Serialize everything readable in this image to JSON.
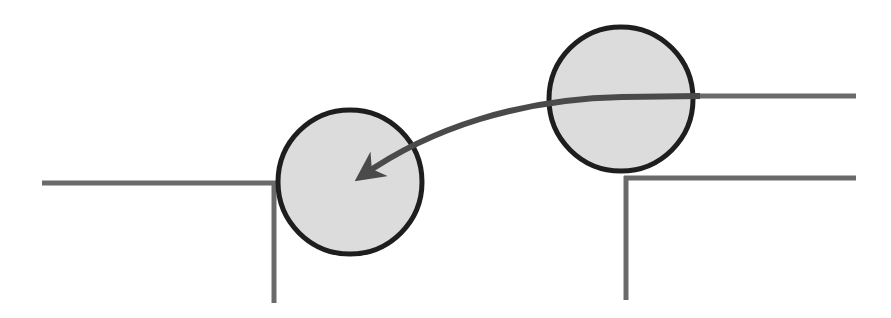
{
  "diagram": {
    "title": "",
    "colors": {
      "background": "#ffffff",
      "step_line": "#6a6a6a",
      "ball_fill": "#dcdcdc",
      "ball_stroke": "#1e1e1e",
      "arrow": "#4a4a4a"
    },
    "steps": [
      {
        "id": "lower-step",
        "horizontal": {
          "x1": 42,
          "y1": 183,
          "x2": 276,
          "y2": 183
        },
        "vertical": {
          "x1": 274,
          "y1": 181,
          "x2": 274,
          "y2": 303
        }
      },
      {
        "id": "upper-step-top-edge",
        "horizontal": {
          "x1": 620,
          "y1": 96,
          "x2": 856,
          "y2": 96
        }
      },
      {
        "id": "upper-step-lower-edge",
        "horizontal": {
          "x1": 624,
          "y1": 178,
          "x2": 856,
          "y2": 178
        },
        "vertical": {
          "x1": 626,
          "y1": 176,
          "x2": 626,
          "y2": 300
        }
      }
    ],
    "balls": [
      {
        "id": "ball-end",
        "cx": 350,
        "cy": 182,
        "r": 72
      },
      {
        "id": "ball-start",
        "cx": 621,
        "cy": 99,
        "r": 72
      }
    ],
    "arrow": {
      "path": "M 700 96 L 622 97 C 520 99 430 128 362 176",
      "head": {
        "tip_x": 350,
        "tip_y": 182
      }
    }
  }
}
